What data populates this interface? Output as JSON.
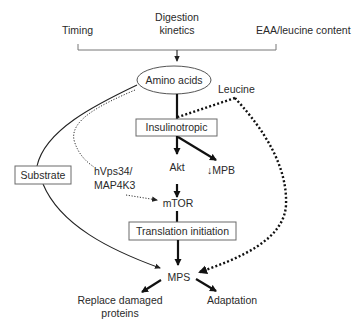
{
  "diagram": {
    "inputs": {
      "timing": "Timing",
      "digestion_line1": "Digestion",
      "digestion_line2": "kinetics",
      "eaa": "EAA/leucine content"
    },
    "nodes": {
      "amino_acids": "Amino acids",
      "leucine": "Leucine",
      "insulinotropic": "Insulinotropic",
      "substrate": "Substrate",
      "hvps34_line1": "hVps34/",
      "hvps34_line2": "MAP4K3",
      "akt": "Akt",
      "mpb": "↓MPB",
      "mtor": "mTOR",
      "translation_initiation": "Translation initiation",
      "mps": "MPS",
      "replace_line1": "Replace damaged",
      "replace_line2": "proteins",
      "adaptation": "Adaptation"
    },
    "edges": [
      {
        "from": "inputs",
        "to": "Amino acids",
        "style": "thin-arrow"
      },
      {
        "from": "Amino acids",
        "to": "Insulinotropic",
        "style": "thick"
      },
      {
        "from": "Leucine",
        "to": "Insulinotropic",
        "style": "bold-dotted"
      },
      {
        "from": "Leucine",
        "to": "MPS",
        "style": "bold-dotted-arrow"
      },
      {
        "from": "Insulinotropic",
        "to": "Akt",
        "style": "thick-arrow"
      },
      {
        "from": "Insulinotropic",
        "to": "↓MPB",
        "style": "thick-arrow"
      },
      {
        "from": "Akt",
        "to": "mTOR",
        "style": "thick-arrow"
      },
      {
        "from": "mTOR",
        "to": "Translation initiation",
        "style": "thick"
      },
      {
        "from": "Translation initiation",
        "to": "MPS",
        "style": "thick-arrow"
      },
      {
        "from": "Amino acids",
        "to": "Substrate",
        "style": "thin-curve"
      },
      {
        "from": "Substrate",
        "to": "MPS",
        "style": "thin-curve-arrow"
      },
      {
        "from": "Amino acids",
        "to": "mTOR",
        "via": "hVps34/MAP4K3",
        "style": "fine-dotted-arrow"
      },
      {
        "from": "MPS",
        "to": "Replace damaged proteins",
        "style": "thick-arrow"
      },
      {
        "from": "MPS",
        "to": "Adaptation",
        "style": "thick-arrow"
      }
    ]
  }
}
